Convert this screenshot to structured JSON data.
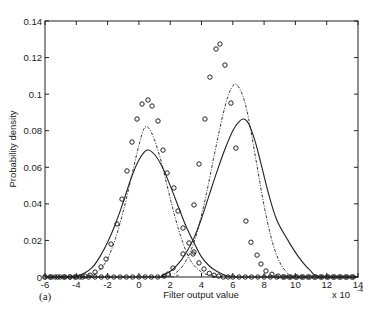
{
  "chart_data": {
    "type": "line",
    "title": "",
    "panel_label": "(a)",
    "xlabel": "Filter output value",
    "ylabel": "Probability density",
    "x_multiplier": "x 10",
    "x_multiplier_exp": "-4",
    "xlim": [
      -6,
      14
    ],
    "ylim": [
      0,
      0.14
    ],
    "xticks": [
      -6,
      -4,
      -2,
      0,
      2,
      4,
      6,
      8,
      10,
      12,
      14
    ],
    "yticks": [
      0,
      0.02,
      0.04,
      0.06,
      0.08,
      0.1,
      0.12,
      0.14
    ],
    "ytick_labels": [
      "0",
      "0.02",
      "0.04",
      "0.06",
      "0.08",
      "0.1",
      "0.12",
      "0.14"
    ],
    "grid": false,
    "legend": null,
    "series": [
      {
        "name": "class 1 histogram (circles)",
        "style": "markers-circle",
        "x": [
          -6,
          -5.68,
          -5.36,
          -5.04,
          -4.72,
          -4.4,
          -4.08,
          -3.76,
          -3.44,
          -3.12,
          -2.8,
          -2.42,
          -2.1,
          -1.78,
          -1.4,
          -1.08,
          -0.76,
          -0.44,
          -0.12,
          0.2,
          0.58,
          0.84,
          1.22,
          1.54,
          1.8,
          2.24,
          2.5,
          2.82,
          3.2,
          3.46,
          3.84,
          4.16,
          4.5,
          4.8,
          5.1,
          5.4,
          5.7,
          6.0,
          6.4,
          6.8,
          7.2,
          7.6,
          8.0,
          8.4,
          8.8,
          9.2,
          9.6,
          10.0,
          10.4,
          10.8,
          11.2,
          11.6,
          12.0,
          12.4,
          12.8,
          13.2,
          13.6
        ],
        "y": [
          0,
          0,
          0,
          0,
          0,
          0,
          0,
          0,
          0.0005,
          0.001,
          0.0027,
          0.0055,
          0.0098,
          0.018,
          0.029,
          0.0426,
          0.058,
          0.0738,
          0.0864,
          0.0946,
          0.0968,
          0.0935,
          0.0853,
          0.0694,
          0.0569,
          0.0487,
          0.0361,
          0.0268,
          0.0186,
          0.0126,
          0.0077,
          0.0044,
          0.002,
          0.001,
          0.0005,
          0,
          0,
          0,
          0,
          0,
          0,
          0,
          0,
          0,
          0,
          0,
          0,
          0,
          0,
          0,
          0,
          0,
          0,
          0,
          0,
          0,
          0
        ]
      },
      {
        "name": "class 2 histogram (circles)",
        "style": "markers-circle",
        "x": [
          -6,
          -5.6,
          -5.2,
          -4.8,
          -4.4,
          -4.0,
          -3.6,
          -3.2,
          -2.8,
          -2.4,
          -2.0,
          -1.6,
          -1.2,
          -0.8,
          -0.4,
          0,
          0.4,
          0.8,
          1.2,
          1.6,
          1.86,
          2.18,
          2.82,
          3.52,
          3.52,
          3.84,
          4.22,
          4.54,
          4.93,
          5.18,
          5.5,
          5.88,
          6.2,
          6.84,
          7.16,
          7.55,
          7.8,
          8.12,
          8.5,
          8.9,
          9.3,
          9.7,
          10.1,
          10.5,
          10.9,
          11.3,
          11.7,
          12.1,
          12.5,
          12.9,
          13.3,
          13.7
        ],
        "y": [
          0,
          0,
          0,
          0,
          0,
          0,
          0,
          0,
          0,
          0,
          0,
          0,
          0,
          0,
          0,
          0,
          0,
          0,
          0,
          0.0005,
          0.0016,
          0.0049,
          0.0126,
          0.0137,
          0.0394,
          0.0618,
          0.0864,
          0.1093,
          0.1247,
          0.1274,
          0.1159,
          0.0951,
          0.0705,
          0.0306,
          0.019,
          0.012,
          0.0071,
          0.0033,
          0.0015,
          0.0005,
          0,
          0,
          0,
          0,
          0,
          0,
          0,
          0,
          0,
          0,
          0,
          0
        ]
      },
      {
        "name": "class 1 fitted density (solid)",
        "style": "solid",
        "x": [
          -6,
          -5,
          -4,
          -3.5,
          -3,
          -2.5,
          -2,
          -1.5,
          -1,
          -0.5,
          0,
          0.52,
          1,
          1.5,
          2,
          2.5,
          3,
          3.5,
          4,
          4.5,
          5,
          5.5,
          6,
          7,
          8,
          10,
          14
        ],
        "y": [
          0,
          0,
          0.0005,
          0.002,
          0.005,
          0.011,
          0.019,
          0.029,
          0.041,
          0.054,
          0.064,
          0.0694,
          0.067,
          0.06,
          0.05,
          0.039,
          0.028,
          0.019,
          0.011,
          0.006,
          0.003,
          0.001,
          0,
          0,
          0,
          0,
          0
        ]
      },
      {
        "name": "class 1 fitted density (dash-dot)",
        "style": "dashdot",
        "x": [
          -6,
          -4,
          -3,
          -2.5,
          -2,
          -1.5,
          -1,
          -0.5,
          0,
          0.39,
          0.8,
          1.3,
          1.8,
          2.3,
          2.8,
          3.3,
          3.8,
          4.3,
          4.8,
          5.5,
          14
        ],
        "y": [
          0,
          0,
          0.001,
          0.004,
          0.01,
          0.021,
          0.036,
          0.054,
          0.072,
          0.082,
          0.079,
          0.067,
          0.05,
          0.033,
          0.019,
          0.009,
          0.004,
          0.0015,
          0.0005,
          0,
          0
        ]
      },
      {
        "name": "class 2 fitted density (solid)",
        "style": "solid",
        "x": [
          -6,
          1,
          1.5,
          2,
          2.5,
          3,
          3.5,
          4,
          4.5,
          5,
          5.5,
          6,
          6.4,
          6.7,
          7.0,
          7.4,
          7.8,
          8.3,
          8.82,
          9.53,
          10.2,
          10.9,
          11.6,
          14
        ],
        "y": [
          0,
          0,
          0.001,
          0.003,
          0.007,
          0.013,
          0.021,
          0.032,
          0.045,
          0.058,
          0.07,
          0.08,
          0.085,
          0.0864,
          0.084,
          0.075,
          0.062,
          0.045,
          0.031,
          0.02,
          0.011,
          0.004,
          0,
          0
        ]
      },
      {
        "name": "class 2 fitted density (dash-dot)",
        "style": "dashdot",
        "x": [
          -6,
          1.8,
          2.3,
          2.8,
          3.3,
          3.8,
          4.3,
          4.8,
          5.3,
          5.7,
          6.14,
          6.6,
          7.0,
          7.5,
          8.0,
          8.5,
          9.0,
          9.5,
          9.85,
          14
        ],
        "y": [
          0,
          0,
          0.002,
          0.006,
          0.014,
          0.027,
          0.045,
          0.066,
          0.086,
          0.099,
          0.1055,
          0.1,
          0.087,
          0.063,
          0.039,
          0.02,
          0.008,
          0.002,
          0,
          0
        ]
      }
    ]
  }
}
